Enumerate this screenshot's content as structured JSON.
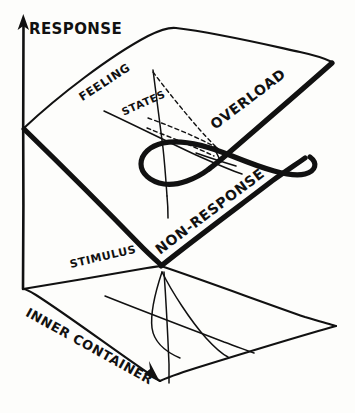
{
  "figure": {
    "style": "hand-drawn ink line diagram",
    "background_color": "#fdfdfb",
    "ink_color": "#111111",
    "width": 355,
    "height": 413
  },
  "axes": {
    "vertical": {
      "label": "RESPONSE",
      "icon": "up-arrow-icon",
      "direction": "up"
    }
  },
  "labels": {
    "response": "RESPONSE",
    "feeling": "FEELING",
    "states": "STATES",
    "overload": "OVERLOAD",
    "non_response": "NON-RESPONSE",
    "stimulus": "STIMULUS",
    "inner_container": "INNER CONTAINER"
  },
  "surfaces": {
    "behaviour_sheet": {
      "name": "folded response surface",
      "edge_style": "thick-front-edge",
      "fold_curve": "cusp fold"
    },
    "control_plane": {
      "name": "inner container base plane",
      "edge_style": "thin-parallelogram",
      "contains": "projected cusp bifurcation lines"
    }
  },
  "annotations": {
    "dashed_lines": "hidden trajectory lines on upper sheet",
    "arrowheads": [
      "response-axis-arrow",
      "inner-container-arrow"
    ]
  }
}
